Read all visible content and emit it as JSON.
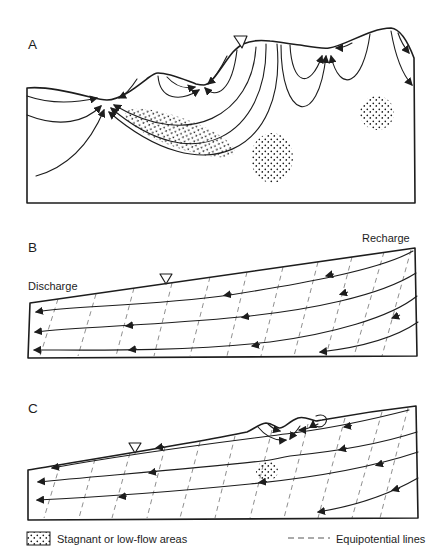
{
  "figure": {
    "background_color": "#ffffff",
    "line_color": "#1d1d1d",
    "equipotential_color": "#8f8f8f",
    "panels": {
      "a": {
        "label": "A"
      },
      "b": {
        "label": "B",
        "discharge_label": "Discharge",
        "recharge_label": "Recharge"
      },
      "c": {
        "label": "C"
      }
    },
    "legend": {
      "stagnant_label": "Stagnant or low-flow areas",
      "equipotential_label": "Equipotential lines"
    }
  }
}
